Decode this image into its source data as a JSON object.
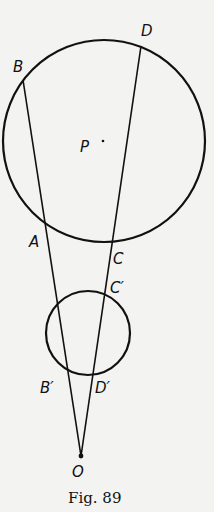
{
  "figure": {
    "caption": "Fig. 89",
    "ink_color": "#111111",
    "background_color": "#f3f3f1"
  },
  "circles": [
    {
      "name": "large-circle",
      "cx": 104,
      "cy": 141,
      "r": 101
    },
    {
      "name": "small-circle",
      "cx": 88,
      "cy": 333,
      "r": 42
    }
  ],
  "lines": [
    {
      "name": "line-OB",
      "from": "O",
      "to": "B",
      "x1": 81,
      "y1": 456,
      "x2": 23,
      "y2": 80
    },
    {
      "name": "line-OD",
      "from": "O",
      "to": "D",
      "x1": 81,
      "y1": 456,
      "x2": 141,
      "y2": 46
    }
  ],
  "points": {
    "B": {
      "label": "B",
      "x": 13,
      "y": 72
    },
    "D": {
      "label": "D",
      "x": 141,
      "y": 36
    },
    "P": {
      "label": "P",
      "x": 80,
      "y": 152
    },
    "A": {
      "label": "A",
      "x": 29,
      "y": 247
    },
    "C": {
      "label": "C",
      "x": 113,
      "y": 264
    },
    "C_prime": {
      "label": "C′",
      "x": 110,
      "y": 293
    },
    "B_prime": {
      "label": "B′",
      "x": 40,
      "y": 393
    },
    "D_prime": {
      "label": "D′",
      "x": 95,
      "y": 393
    },
    "O": {
      "label": "O",
      "x": 72,
      "y": 477
    }
  },
  "center_dot": {
    "x": 103,
    "y": 141
  }
}
